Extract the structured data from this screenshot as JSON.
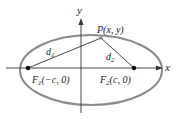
{
  "diagram": {
    "type": "ellipse-foci",
    "axes": {
      "x_label": "x",
      "y_label": "y"
    },
    "point": {
      "label": "P(x, y)"
    },
    "foci": [
      {
        "name": "F1",
        "label_main": "F",
        "label_sub": "1",
        "label_rest": "(−c, 0)"
      },
      {
        "name": "F2",
        "label_main": "F",
        "label_sub": "2",
        "label_rest": "(c, 0)"
      }
    ],
    "distances": [
      {
        "label_main": "d",
        "label_sub": "1"
      },
      {
        "label_main": "d",
        "label_sub": "2"
      }
    ],
    "colors": {
      "ellipse": "#8a8a8a",
      "lines": "#333333",
      "points": "#111111"
    }
  }
}
